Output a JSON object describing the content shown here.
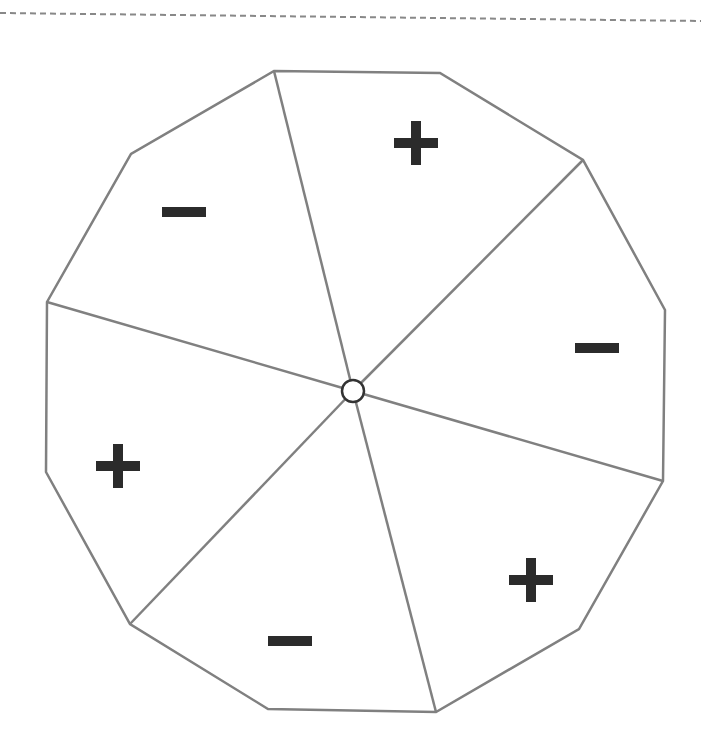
{
  "diagram": {
    "type": "dodecagon divided into six sectors with alternating signs",
    "colors": {
      "outline": "#808080",
      "sign": "#2b2b2b",
      "center_stroke": "#333333",
      "dashed_line": "#888888",
      "background": "#ffffff"
    },
    "top_rule": {
      "style": "dashed",
      "x1": 0,
      "y1": 13,
      "x2": 701,
      "y2": 21
    },
    "polygon_vertices": [
      [
        274,
        71
      ],
      [
        440,
        73
      ],
      [
        583,
        160
      ],
      [
        665,
        310
      ],
      [
        663,
        481
      ],
      [
        579,
        629
      ],
      [
        436,
        712
      ],
      [
        268,
        709
      ],
      [
        130,
        624
      ],
      [
        46,
        472
      ],
      [
        47,
        302
      ],
      [
        131,
        154
      ]
    ],
    "center": {
      "x": 353,
      "y": 391,
      "r": 11
    },
    "spoke_endpoints": [
      [
        274,
        71
      ],
      [
        583,
        160
      ],
      [
        663,
        481
      ],
      [
        436,
        712
      ],
      [
        130,
        624
      ],
      [
        47,
        302
      ]
    ],
    "sectors": [
      {
        "position": "top",
        "sign": "+",
        "x": 416,
        "y": 143
      },
      {
        "position": "upper-right",
        "sign": "−",
        "x": 597,
        "y": 348
      },
      {
        "position": "lower-right",
        "sign": "+",
        "x": 531,
        "y": 580
      },
      {
        "position": "bottom",
        "sign": "−",
        "x": 290,
        "y": 641
      },
      {
        "position": "lower-left",
        "sign": "+",
        "x": 118,
        "y": 466
      },
      {
        "position": "upper-left",
        "sign": "−",
        "x": 184,
        "y": 212
      }
    ]
  }
}
